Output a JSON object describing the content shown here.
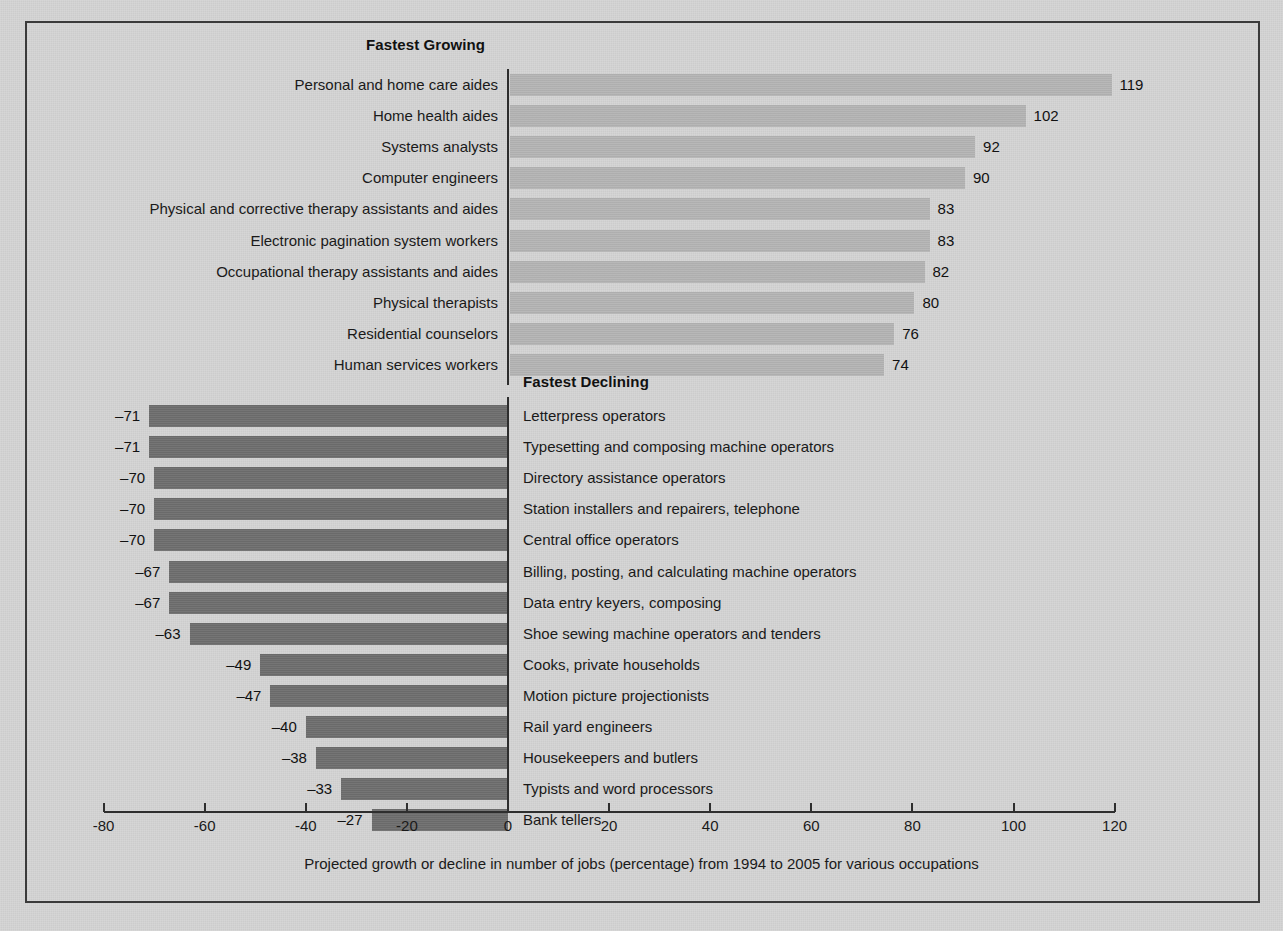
{
  "chart_data": {
    "type": "bar",
    "orientation": "horizontal",
    "title": "",
    "xlabel": "Projected growth or decline in number of jobs (percentage) from 1994 to 2005 for various occupations",
    "ylabel": "",
    "xlim": [
      -80,
      120
    ],
    "xticks": [
      -80,
      -60,
      -40,
      -20,
      0,
      20,
      40,
      60,
      80,
      100,
      120
    ],
    "xtick_labels": [
      "-80",
      "-60",
      "-40",
      "-20",
      "0",
      "20",
      "40",
      "60",
      "80",
      "100",
      "120"
    ],
    "grid": false,
    "legend": null,
    "groups": [
      {
        "name": "Fastest Growing",
        "header": "Fastest Growing",
        "bar_color": "#b4b4b4",
        "categories": [
          "Personal and home care aides",
          "Home health aides",
          "Systems analysts",
          "Computer engineers",
          "Physical and corrective therapy assistants and aides",
          "Electronic pagination system workers",
          "Occupational therapy assistants and aides",
          "Physical therapists",
          "Residential counselors",
          "Human services workers"
        ],
        "values": [
          119,
          102,
          92,
          90,
          83,
          83,
          82,
          80,
          76,
          74
        ],
        "value_labels": [
          "119",
          "102",
          "92",
          "90",
          "83",
          "83",
          "82",
          "80",
          "76",
          "74"
        ]
      },
      {
        "name": "Fastest Declining",
        "header": "Fastest Declining",
        "bar_color": "#6e6e6e",
        "categories": [
          "Letterpress operators",
          "Typesetting and composing machine operators",
          "Directory assistance operators",
          "Station installers and repairers, telephone",
          "Central office operators",
          "Billing, posting, and calculating machine operators",
          "Data entry keyers, composing",
          "Shoe sewing machine operators and tenders",
          "Cooks, private households",
          "Motion picture projectionists",
          "Rail yard engineers",
          "Housekeepers and butlers",
          "Typists and word processors",
          "Bank tellers"
        ],
        "values": [
          -71,
          -71,
          -70,
          -70,
          -70,
          -67,
          -67,
          -63,
          -49,
          -47,
          -40,
          -38,
          -33,
          -27
        ],
        "value_labels": [
          "–71",
          "–71",
          "–70",
          "–70",
          "–70",
          "–67",
          "–67",
          "–63",
          "–49",
          "–47",
          "–40",
          "–38",
          "–33",
          "–27"
        ]
      }
    ]
  },
  "caption": "Projected growth or decline in number of jobs (percentage) from 1994 to 2005 for various occupations",
  "colors": {
    "background": "#d4d4d4",
    "frame": "#3a3a3a",
    "grow_bar": "#b4b4b4",
    "decline_bar": "#6e6e6e",
    "text": "#1a1a1a"
  }
}
